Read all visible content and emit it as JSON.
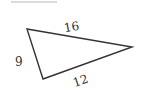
{
  "diagram": {
    "type": "triangle",
    "top_line": {
      "x1": 11,
      "y1": 2,
      "x2": 57,
      "y2": 2,
      "color": "#c8c8c8"
    },
    "vertices": {
      "left": [
        27,
        29
      ],
      "right": [
        132,
        47
      ],
      "bottom": [
        43,
        79
      ]
    },
    "stroke_color": "#333333",
    "sides": [
      {
        "name": "top",
        "label": "16"
      },
      {
        "name": "left",
        "label": "9"
      },
      {
        "name": "bottom",
        "label": "12"
      }
    ]
  }
}
